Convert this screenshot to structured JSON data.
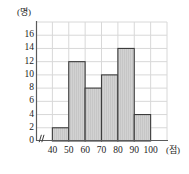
{
  "chart_data": {
    "type": "bar",
    "title": "",
    "subtitle": "",
    "xlabel": "(점)",
    "ylabel": "(명)",
    "x_unit_label": "(점)",
    "y_unit_label": "(명)",
    "categories": [
      "40~50",
      "50~60",
      "60~70",
      "70~80",
      "80~90",
      "90~100"
    ],
    "bin_edges": [
      40,
      50,
      60,
      70,
      80,
      90,
      100
    ],
    "values": [
      2,
      12,
      8,
      10,
      14,
      4
    ],
    "x_tick_labels": [
      "40",
      "50",
      "60",
      "70",
      "80",
      "90",
      "100"
    ],
    "x_tick_values": [
      40,
      50,
      60,
      70,
      80,
      90,
      100
    ],
    "y_tick_labels": [
      "0",
      "2",
      "4",
      "6",
      "8",
      "10",
      "12",
      "14",
      "16"
    ],
    "y_tick_values": [
      0,
      2,
      4,
      6,
      8,
      10,
      12,
      14,
      16
    ],
    "xlim": [
      30,
      110
    ],
    "ylim": [
      0,
      18
    ],
    "grid": true,
    "legend": "none",
    "axis_break": true,
    "axis_break_symbol": "//",
    "bar_fill_color": "#d2d2d2",
    "bar_edge_color": "#3c3c3c",
    "grid_color": "#d8d8d8",
    "axis_color": "#5a5a5a",
    "text_color": "#1c1c1c",
    "background_color": "#ffffff"
  }
}
